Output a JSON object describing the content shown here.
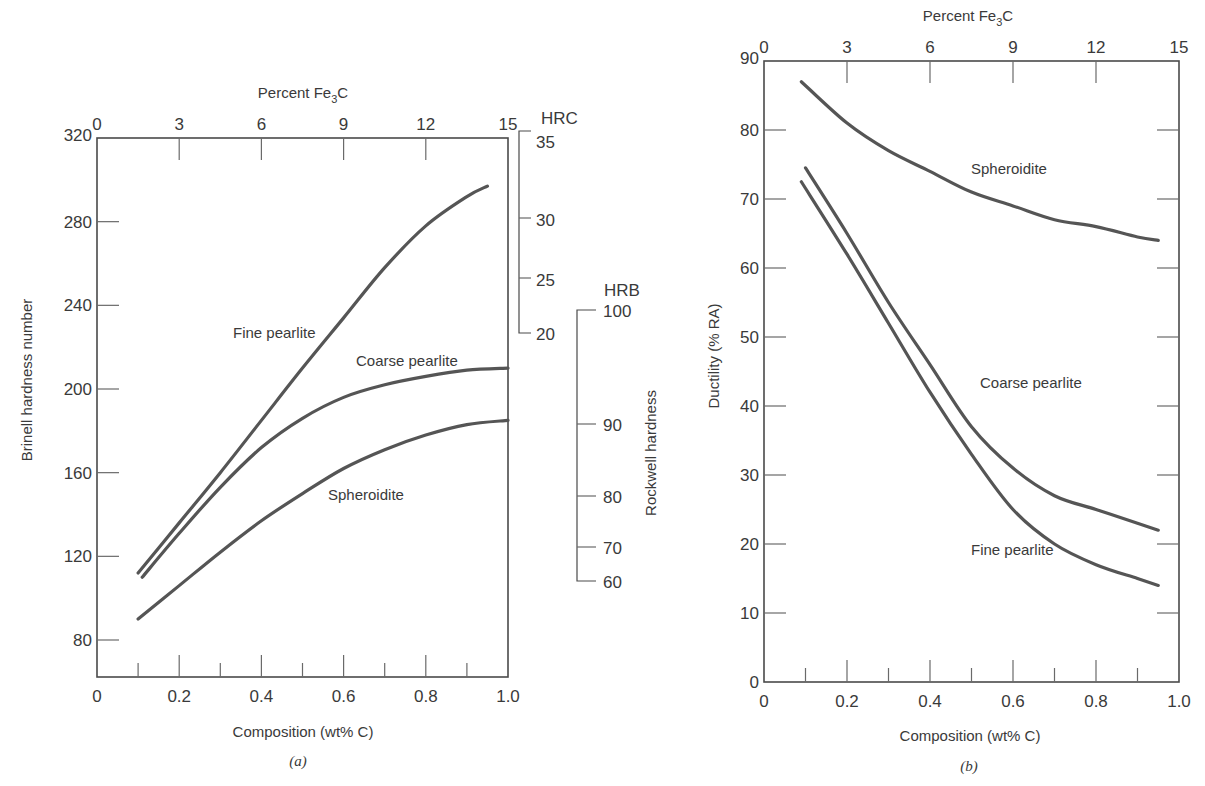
{
  "chart_data": [
    {
      "type": "line",
      "panel": "(a)",
      "title": "",
      "xlabel": "Composition (wt% C)",
      "ylabel": "Brinell hardness number",
      "xlim": [
        0,
        1.0
      ],
      "ylim": [
        60,
        320
      ],
      "x_ticks": [
        "0",
        "0.2",
        "0.4",
        "0.6",
        "0.8",
        "1.0"
      ],
      "y_ticks": [
        "80",
        "120",
        "160",
        "200",
        "240",
        "280",
        "320"
      ],
      "top_axis": {
        "label": "Percent Fe3C",
        "label_main": "Percent Fe",
        "label_sub": "3",
        "label_tail": "C",
        "ticks": [
          "0",
          "3",
          "6",
          "9",
          "12",
          "15"
        ]
      },
      "secondary_axes": [
        {
          "label": "HRC",
          "ticks": [
            "35",
            "30",
            "25",
            "20"
          ]
        },
        {
          "label": "HRB",
          "ticks": [
            "100",
            "90",
            "80",
            "70",
            "60"
          ]
        }
      ],
      "secondary_axis_title": "Rockwell hardness",
      "series": [
        {
          "name": "Fine pearlite",
          "x": [
            0.1,
            0.2,
            0.3,
            0.4,
            0.5,
            0.6,
            0.7,
            0.8,
            0.9,
            0.95
          ],
          "values": [
            112,
            136,
            160,
            185,
            210,
            234,
            258,
            278,
            292,
            297
          ]
        },
        {
          "name": "Coarse pearlite",
          "x": [
            0.11,
            0.2,
            0.3,
            0.4,
            0.5,
            0.6,
            0.7,
            0.8,
            0.9,
            1.0
          ],
          "values": [
            110,
            131,
            153,
            172,
            186,
            196,
            202,
            206,
            209,
            210
          ]
        },
        {
          "name": "Spheroidite",
          "x": [
            0.1,
            0.2,
            0.3,
            0.4,
            0.5,
            0.6,
            0.7,
            0.8,
            0.9,
            1.0
          ],
          "values": [
            90,
            106,
            122,
            137,
            150,
            162,
            171,
            178,
            183,
            185
          ]
        }
      ],
      "panel_label": "(a)"
    },
    {
      "type": "line",
      "panel": "(b)",
      "title": "",
      "xlabel": "Composition (wt% C)",
      "ylabel": "Ductility (% RA)",
      "xlim": [
        0,
        1.0
      ],
      "ylim": [
        0,
        90
      ],
      "x_ticks": [
        "0",
        "0.2",
        "0.4",
        "0.6",
        "0.8",
        "1.0"
      ],
      "y_ticks": [
        "0",
        "10",
        "20",
        "30",
        "40",
        "50",
        "60",
        "70",
        "80",
        "90"
      ],
      "top_axis": {
        "label": "Percent Fe3C",
        "label_main": "Percent Fe",
        "label_sub": "3",
        "label_tail": "C",
        "ticks": [
          "0",
          "3",
          "6",
          "9",
          "12",
          "15"
        ]
      },
      "series": [
        {
          "name": "Spheroidite",
          "x": [
            0.09,
            0.2,
            0.3,
            0.4,
            0.5,
            0.6,
            0.7,
            0.8,
            0.9,
            0.95
          ],
          "values": [
            87,
            81,
            77,
            74,
            71,
            69,
            67,
            66,
            64.5,
            64
          ]
        },
        {
          "name": "Coarse pearlite",
          "x": [
            0.1,
            0.2,
            0.3,
            0.4,
            0.5,
            0.6,
            0.7,
            0.8,
            0.9,
            0.95
          ],
          "values": [
            74.5,
            65,
            55,
            46,
            37,
            31,
            27,
            25,
            23,
            22
          ]
        },
        {
          "name": "Fine pearlite",
          "x": [
            0.09,
            0.2,
            0.3,
            0.4,
            0.5,
            0.6,
            0.7,
            0.8,
            0.9,
            0.95
          ],
          "values": [
            72.5,
            62,
            52,
            42,
            33,
            25,
            20,
            17,
            15,
            14
          ]
        }
      ],
      "panel_label": "(b)"
    }
  ],
  "labels": {
    "a": {
      "top_title_main": "Percent Fe",
      "top_title_sub": "3",
      "top_title_tail": "C",
      "xlabel": "Composition (wt% C)",
      "ylabel": "Brinell hardness number",
      "hrc": "HRC",
      "hrb": "HRB",
      "rockwell": "Rockwell hardness",
      "fine": "Fine pearlite",
      "coarse": "Coarse pearlite",
      "spher": "Spheroidite",
      "panel": "(a)"
    },
    "b": {
      "top_title_main": "Percent Fe",
      "top_title_sub": "3",
      "top_title_tail": "C",
      "xlabel": "Composition (wt% C)",
      "ylabel": "Ductility (% RA)",
      "fine": "Fine pearlite",
      "coarse": "Coarse pearlite",
      "spher": "Spheroidite",
      "panel": "(b)"
    }
  }
}
